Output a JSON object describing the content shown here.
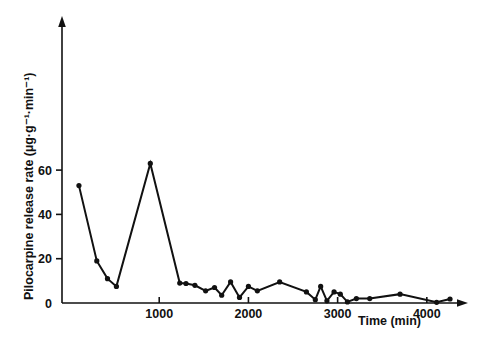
{
  "figure": {
    "background_color": "#ffffff",
    "ink_color": "#111111"
  },
  "chart_data": {
    "type": "line",
    "title": "",
    "subtitle": "",
    "xlabel": "Time (min)",
    "ylabel": "Pilocarpine release rate (µg·g⁻¹·min⁻¹)",
    "ylabel_plain": "Pilocarpine release rate",
    "ylabel_units": "(µg·g⁻¹·min⁻¹)",
    "xlim": [
      -90,
      4400
    ],
    "ylim": [
      0,
      66
    ],
    "xticks": [
      1000,
      2000,
      3000,
      4000
    ],
    "xtick_labels": [
      "1000",
      "2000",
      "3000",
      "4000"
    ],
    "yticks": [
      0,
      20,
      40,
      60
    ],
    "ytick_labels": [
      "0",
      "20",
      "40",
      "60"
    ],
    "grid": false,
    "legend": null,
    "legend_position": "none",
    "marker": "filled-circle",
    "axis_arrows": true,
    "annotations": [],
    "series": [
      {
        "name": "pilocarpine release rate",
        "x": [
          100,
          300,
          420,
          520,
          900,
          1230,
          1300,
          1400,
          1520,
          1620,
          1700,
          1800,
          1900,
          2000,
          2100,
          2350,
          2650,
          2750,
          2810,
          2880,
          2960,
          3030,
          3110,
          3210,
          3360,
          3700,
          4110,
          4260
        ],
        "y": [
          53.0,
          19.0,
          11.0,
          7.5,
          63.0,
          9.0,
          8.8,
          8.0,
          5.5,
          7.0,
          3.5,
          9.5,
          2.5,
          7.5,
          5.5,
          9.5,
          5.0,
          1.5,
          7.5,
          1.0,
          5.0,
          4.0,
          0.5,
          2.0,
          2.0,
          4.0,
          0.3,
          1.8
        ]
      }
    ]
  }
}
